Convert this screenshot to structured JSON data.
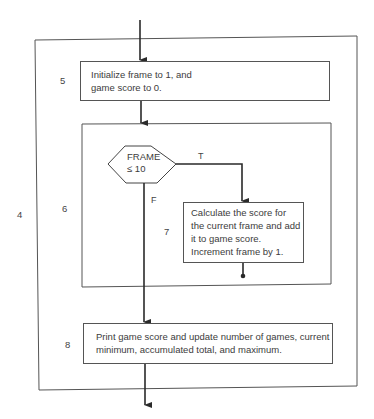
{
  "diagram": {
    "type": "nested flowchart",
    "outer_block": {
      "number": "4"
    },
    "step5": {
      "number": "5",
      "line1": "Initialize frame to 1, and",
      "line2": "game score to 0."
    },
    "loop_block": {
      "number": "6",
      "decision": {
        "line1": "FRAME",
        "line2": "≤ 10",
        "true_label": "T",
        "false_label": "F"
      }
    },
    "step7": {
      "number": "7",
      "line1": "Calculate the score for",
      "line2": "the current frame and add",
      "line3": "it to game score.",
      "line4": "Increment frame by 1."
    },
    "step8": {
      "number": "8",
      "line1": "Print game score and update number of games, current",
      "line2": "minimum, accumulated total, and maximum."
    },
    "colors": {
      "line": "#2a2a2a",
      "box_border": "#555555",
      "text": "#3c3c3c"
    }
  }
}
